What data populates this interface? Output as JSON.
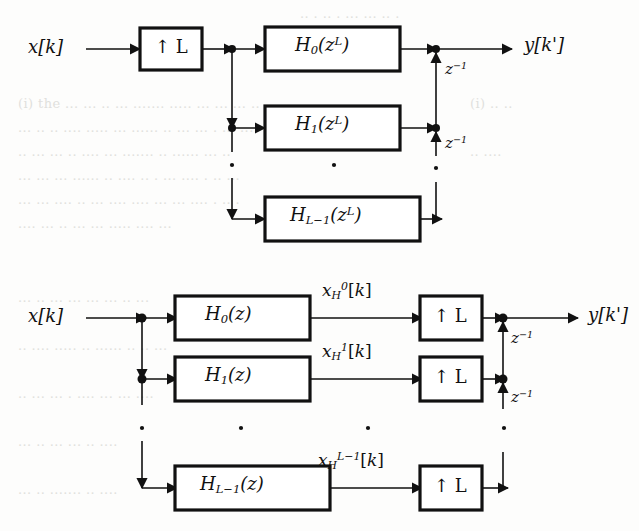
{
  "figure": {
    "type": "signal-flow-block-diagram",
    "background_text": [
      "nally we use the IDFT of size L",
      "the spectrum of the",
      "the filters and the",
      "the input signal",
      "in the following we"
    ]
  },
  "diagrams": [
    {
      "id": "upper",
      "name": "noble-identity-before",
      "input_label": "x[k]",
      "output_label": "y[k']",
      "upsampler_label": "↑ L",
      "upsampler_count": 1,
      "upsampler_position": "input",
      "branches": [
        {
          "filter": "H",
          "sub": "0",
          "arg": "z",
          "argsup": "L",
          "delay": "z",
          "delaysup": "-1"
        },
        {
          "filter": "H",
          "sub": "1",
          "arg": "z",
          "argsup": "L",
          "delay": "z",
          "delaysup": "-1"
        },
        {
          "filter": "H",
          "sub": "L-1",
          "arg": "z",
          "argsup": "L",
          "delay": "",
          "delaysup": ""
        }
      ],
      "ellipsis_dots": 3
    },
    {
      "id": "lower",
      "name": "noble-identity-after",
      "input_label": "x[k]",
      "output_label": "y[k']",
      "upsampler_label": "↑ L",
      "upsampler_count": 3,
      "upsampler_position": "after-filter",
      "branches": [
        {
          "filter": "H",
          "sub": "0",
          "arg": "z",
          "argsup": "",
          "signal": "x",
          "signalsub": "H",
          "signalsup": "0",
          "signalidx": "[k]",
          "delay": "z",
          "delaysup": "-1"
        },
        {
          "filter": "H",
          "sub": "1",
          "arg": "z",
          "argsup": "",
          "signal": "x",
          "signalsub": "H",
          "signalsup": "1",
          "signalidx": "[k]",
          "delay": "z",
          "delaysup": "-1"
        },
        {
          "filter": "H",
          "sub": "L-1",
          "arg": "z",
          "argsup": "",
          "signal": "x",
          "signalsub": "H",
          "signalsup": "L-1",
          "signalidx": "[k]",
          "delay": "",
          "delaysup": ""
        }
      ],
      "ellipsis_dots": 4
    }
  ],
  "labels": {
    "x_of_k": "x[k]",
    "y_of_kprime": "y[k']",
    "up_L": "↑ L",
    "z_inv": "z",
    "z_inv_sup": "-1",
    "H0_zL": "H₀(z^L)",
    "H1_zL": "H₁(z^L)",
    "HLm1_zL": "H_{L-1}(z^L)",
    "H0_z": "H₀(z)",
    "H1_z": "H₁(z)",
    "HLm1_z": "H_{L-1}(z)",
    "xH0": "x_H^0[k]",
    "xH1": "x_H^1[k]",
    "xHLm1": "x_H^{L-1}[k]"
  },
  "colors": {
    "ink": "#111111",
    "paper": "#fdfdfc",
    "bleed": "#c9c9c4"
  }
}
